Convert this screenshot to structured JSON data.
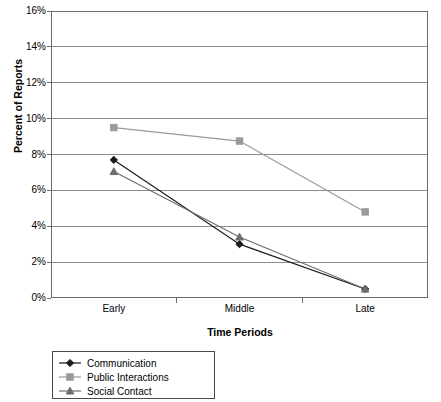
{
  "chart_data": {
    "type": "line",
    "title": "",
    "xlabel": "Time Periods",
    "ylabel": "Percent of Reports",
    "categories": [
      "Early",
      "Middle",
      "Late"
    ],
    "ylim": [
      0,
      16
    ],
    "ytick_labels": [
      "0%",
      "2%",
      "4%",
      "6%",
      "8%",
      "10%",
      "12%",
      "14%",
      "16%"
    ],
    "ytick_values": [
      0,
      2,
      4,
      6,
      8,
      10,
      12,
      14,
      16
    ],
    "grid": true,
    "legend_position": "below-left",
    "series": [
      {
        "name": "Communication",
        "marker": "diamond",
        "color": "#1a1a1a",
        "line_color": "#1a1a1a",
        "values": [
          7.7,
          3.0,
          0.5
        ]
      },
      {
        "name": "Public Interactions",
        "marker": "square",
        "color": "#9a9a9a",
        "line_color": "#9a9a9a",
        "values": [
          9.5,
          8.75,
          4.8
        ]
      },
      {
        "name": "Social Contact",
        "marker": "triangle",
        "color": "#6e6e6e",
        "line_color": "#6e6e6e",
        "values": [
          7.05,
          3.4,
          0.5
        ]
      }
    ]
  },
  "axes": {
    "y_title": "Percent of Reports",
    "x_title": "Time Periods"
  },
  "legend": {
    "entries": [
      {
        "label": "Communication"
      },
      {
        "label": "Public Interactions"
      },
      {
        "label": "Social Contact"
      }
    ]
  },
  "colors": {
    "plot_border": "#6b6b6b",
    "gridline": "#8c8c8c",
    "background": "#ffffff",
    "series_1": "#1a1a1a",
    "series_2": "#9a9a9a",
    "series_3": "#6e6e6e"
  }
}
